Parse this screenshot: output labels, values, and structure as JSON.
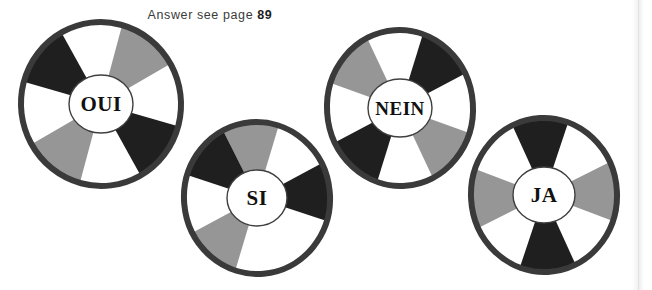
{
  "caption": {
    "text": "Answer see page",
    "page_number": "89"
  },
  "palette": {
    "background": "#ffffff",
    "black_sector": "#1f1f1f",
    "gray_sector": "#969696",
    "white_sector": "#ffffff",
    "ring": "#3a3a3a",
    "label_text": "#111111",
    "label_border": "#3f3f3f",
    "page_edge": "#e2e2e2"
  },
  "wheels": [
    {
      "id": "wheel-oui",
      "label": "OUI",
      "cx": 101,
      "cy": 104,
      "rx": 80,
      "ry": 82,
      "rotation": -7,
      "ring_width": 6,
      "hub_rx": 32,
      "hub_ry": 29,
      "label_font_size": 21,
      "sectors": [
        {
          "from": -22.5,
          "to": 22.5,
          "color": "#ffffff"
        },
        {
          "from": 22.5,
          "to": 67.5,
          "color": "#969696"
        },
        {
          "from": 67.5,
          "to": 112.5,
          "color": "#ffffff"
        },
        {
          "from": 112.5,
          "to": 157.5,
          "color": "#1f1f1f"
        },
        {
          "from": 157.5,
          "to": 202.5,
          "color": "#ffffff"
        },
        {
          "from": 202.5,
          "to": 247.5,
          "color": "#969696"
        },
        {
          "from": 247.5,
          "to": 292.5,
          "color": "#ffffff"
        },
        {
          "from": 292.5,
          "to": 337.5,
          "color": "#1f1f1f"
        }
      ]
    },
    {
      "id": "wheel-si",
      "label": "SI",
      "cx": 257,
      "cy": 198,
      "rx": 73,
      "ry": 76,
      "rotation": -5,
      "ring_width": 6,
      "hub_rx": 30,
      "hub_ry": 28,
      "label_font_size": 21,
      "sectors": [
        {
          "from": -22.5,
          "to": 22.5,
          "color": "#969696"
        },
        {
          "from": 22.5,
          "to": 67.5,
          "color": "#ffffff"
        },
        {
          "from": 67.5,
          "to": 112.5,
          "color": "#1f1f1f"
        },
        {
          "from": 112.5,
          "to": 157.5,
          "color": "#ffffff"
        },
        {
          "from": 157.5,
          "to": 202.5,
          "color": "#ffffff"
        },
        {
          "from": 202.5,
          "to": 247.5,
          "color": "#969696"
        },
        {
          "from": 247.5,
          "to": 292.5,
          "color": "#ffffff"
        },
        {
          "from": 292.5,
          "to": 337.5,
          "color": "#1f1f1f"
        }
      ]
    },
    {
      "id": "wheel-nein",
      "label": "NEIN",
      "cx": 400,
      "cy": 108,
      "rx": 73,
      "ry": 78,
      "rotation": -4,
      "ring_width": 6,
      "hub_rx": 32,
      "hub_ry": 29,
      "label_font_size": 19,
      "sectors": [
        {
          "from": -22.5,
          "to": 22.5,
          "color": "#ffffff"
        },
        {
          "from": 22.5,
          "to": 67.5,
          "color": "#1f1f1f"
        },
        {
          "from": 67.5,
          "to": 112.5,
          "color": "#ffffff"
        },
        {
          "from": 112.5,
          "to": 157.5,
          "color": "#969696"
        },
        {
          "from": 157.5,
          "to": 202.5,
          "color": "#ffffff"
        },
        {
          "from": 202.5,
          "to": 247.5,
          "color": "#1f1f1f"
        },
        {
          "from": 247.5,
          "to": 292.5,
          "color": "#ffffff"
        },
        {
          "from": 292.5,
          "to": 337.5,
          "color": "#969696"
        }
      ]
    },
    {
      "id": "wheel-ja",
      "label": "JA",
      "cx": 544,
      "cy": 195,
      "rx": 73,
      "ry": 77,
      "rotation": -3,
      "ring_width": 6,
      "hub_rx": 31,
      "hub_ry": 28,
      "label_font_size": 21,
      "sectors": [
        {
          "from": -22.5,
          "to": 22.5,
          "color": "#1f1f1f"
        },
        {
          "from": 22.5,
          "to": 67.5,
          "color": "#ffffff"
        },
        {
          "from": 67.5,
          "to": 112.5,
          "color": "#969696"
        },
        {
          "from": 112.5,
          "to": 157.5,
          "color": "#ffffff"
        },
        {
          "from": 157.5,
          "to": 202.5,
          "color": "#1f1f1f"
        },
        {
          "from": 202.5,
          "to": 247.5,
          "color": "#ffffff"
        },
        {
          "from": 247.5,
          "to": 292.5,
          "color": "#969696"
        },
        {
          "from": 292.5,
          "to": 337.5,
          "color": "#ffffff"
        }
      ]
    }
  ],
  "page_edge": {
    "x": 638
  }
}
